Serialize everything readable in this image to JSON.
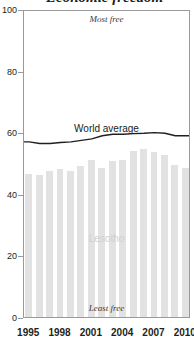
{
  "figure": {
    "title_fragment": "Economic freedom",
    "title_visible_note": "title cropped at top edge"
  },
  "annotations": {
    "most_free": "Most free",
    "least_free": "Least free",
    "world_series_label": "World average",
    "country_series_label": "Lesotho"
  },
  "colors": {
    "bar_fill": "#e2e2e2",
    "line_stroke": "#231f20",
    "axis": "#9a9a9a",
    "text": "#231f20",
    "country_label": "#cfcfcf"
  },
  "chart_data": {
    "type": "bar",
    "title": "Economic freedom",
    "xlabel": "",
    "ylabel": "",
    "xlim": [
      1994.4,
      2010.6
    ],
    "ylim": [
      0,
      100
    ],
    "grid": false,
    "legend": "inline-labels",
    "x_tick_labels": [
      "1995",
      "1998",
      "2001",
      "2004",
      "2007",
      "2010"
    ],
    "x_tick_values": [
      1995,
      1998,
      2001,
      2004,
      2007,
      2010
    ],
    "y_tick_labels": [
      "0",
      "20",
      "40",
      "60",
      "80",
      "100"
    ],
    "y_tick_values": [
      0,
      20,
      40,
      60,
      80,
      100
    ],
    "categories": [
      1995,
      1996,
      1997,
      1998,
      1999,
      2000,
      2001,
      2002,
      2003,
      2004,
      2005,
      2006,
      2007,
      2008,
      2009,
      2010
    ],
    "series": [
      {
        "name": "Lesotho",
        "render": "bar",
        "values": [
          46.5,
          46.0,
          47.5,
          48.0,
          47.5,
          49.0,
          51.0,
          48.5,
          50.5,
          51.0,
          54.0,
          54.5,
          53.5,
          52.5,
          49.5,
          48.5
        ]
      },
      {
        "name": "World average",
        "render": "line",
        "values": [
          57.5,
          57.0,
          57.0,
          57.3,
          57.5,
          58.0,
          58.5,
          59.5,
          60.0,
          60.0,
          60.2,
          60.3,
          60.5,
          60.3,
          59.5,
          59.5
        ]
      }
    ]
  }
}
